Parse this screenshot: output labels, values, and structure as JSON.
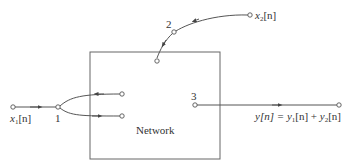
{
  "diagram": {
    "type": "signal-flow network",
    "box_label": "Network",
    "nodes": {
      "node1": {
        "label": "1"
      },
      "node2": {
        "label": "2"
      },
      "node3": {
        "label": "3"
      }
    },
    "inputs": {
      "x1": {
        "var": "x",
        "sub": "1",
        "arg": "[n]"
      },
      "x2": {
        "var": "x",
        "sub": "2",
        "arg": "[n]"
      }
    },
    "output": {
      "lhs": "y[n] = ",
      "t1_var": "y",
      "t1_sub": "1",
      "t1_arg": "[n]",
      "plus": " + ",
      "t2_var": "y",
      "t2_sub": "2",
      "t2_arg": "[n]"
    },
    "colors": {
      "line": "#555555",
      "text": "#333333",
      "background": "#ffffff"
    }
  }
}
